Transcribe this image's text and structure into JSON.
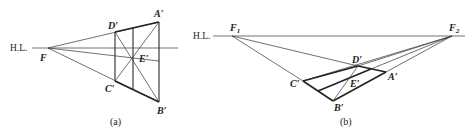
{
  "diagrams": [
    {
      "id": "a",
      "caption": "(a)",
      "horizon_label": "H.L.",
      "labels": {
        "F": "F",
        "A": "A′",
        "B": "B′",
        "C": "C′",
        "D": "D′",
        "E": "E′"
      }
    },
    {
      "id": "b",
      "caption": "(b)",
      "horizon_label": "H.L.",
      "labels": {
        "F1": "F",
        "F1_sub": "1",
        "F2": "F",
        "F2_sub": "2",
        "A": "A′",
        "B": "B′",
        "C": "C′",
        "D": "D′",
        "E": "E′"
      }
    }
  ]
}
